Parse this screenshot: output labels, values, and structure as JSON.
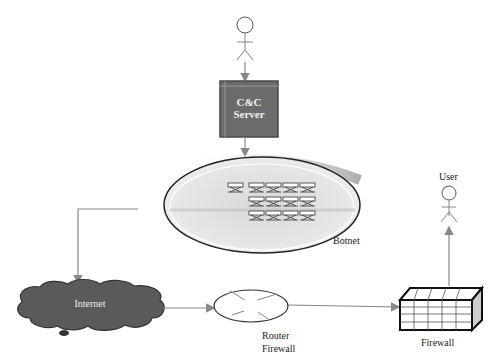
{
  "diagram": {
    "title": "",
    "nodes": {
      "attacker": {
        "label": "",
        "icon": "stick-figure-icon"
      },
      "cc_server": {
        "line1": "C&C",
        "line2": "Server",
        "color": "#6b6b6b"
      },
      "botnet": {
        "label": "Botnet",
        "bot_count": 13
      },
      "internet": {
        "label": "Internet",
        "color": "#5a5a5a"
      },
      "router_firewall": {
        "line1": "Router",
        "line2": "Firewall"
      },
      "firewall": {
        "label": "Firewall"
      },
      "user": {
        "label": "User",
        "icon": "stick-figure-icon"
      }
    },
    "edges": [
      {
        "from": "attacker",
        "to": "cc_server"
      },
      {
        "from": "cc_server",
        "to": "botnet"
      },
      {
        "from": "botnet",
        "to": "internet"
      },
      {
        "from": "internet",
        "to": "router_firewall"
      },
      {
        "from": "router_firewall",
        "to": "firewall"
      },
      {
        "from": "firewall",
        "to": "user"
      }
    ],
    "colors": {
      "arrow": "#888888",
      "outline": "#222222"
    }
  }
}
